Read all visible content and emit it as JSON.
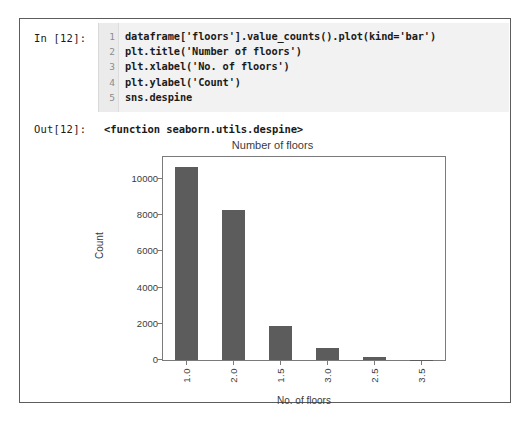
{
  "notebook": {
    "input_prompt": "In [12]:",
    "output_prompt": "Out[12]:",
    "output_text": "<function seaborn.utils.despine>",
    "code_lines": [
      {
        "n": "1",
        "text": "dataframe['floors'].value_counts().plot(kind='bar')"
      },
      {
        "n": "2",
        "text": "plt.title('Number of floors')"
      },
      {
        "n": "3",
        "text": "plt.xlabel('No. of floors')"
      },
      {
        "n": "4",
        "text": "plt.ylabel('Count')"
      },
      {
        "n": "5",
        "text": "sns.despine"
      }
    ]
  },
  "chart_data": {
    "type": "bar",
    "title": "Number of floors",
    "xlabel": "No. of floors",
    "ylabel": "Count",
    "categories": [
      "1.0",
      "2.0",
      "1.5",
      "3.0",
      "2.5",
      "3.5"
    ],
    "values": [
      10650,
      8250,
      1900,
      650,
      150,
      20
    ],
    "ylim": [
      0,
      11200
    ],
    "yticks": [
      0,
      2000,
      4000,
      6000,
      8000,
      10000
    ],
    "ytick_labels": [
      "0",
      "2000",
      "4000",
      "6000",
      "8000",
      "10000"
    ],
    "grid": false,
    "legend": false,
    "bar_color": "#5c5c5c",
    "bar_width_ratio": 0.5
  },
  "colors": {
    "frame_border": "#5c5c5c",
    "code_background": "#f2f2f2",
    "gutter_background": "#ebebeb",
    "axis": "#7a7a7a",
    "text": "#1a1a1a",
    "axis_text": "#3b3b3b"
  }
}
